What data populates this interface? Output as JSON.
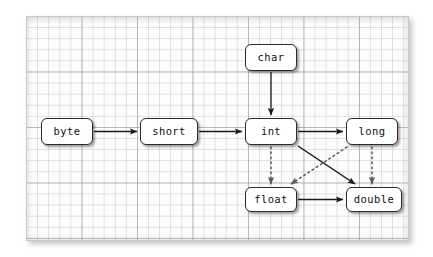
{
  "diagram": {
    "background_color": "#ffffff",
    "panel": {
      "background_color": "#fdfdfd",
      "border_color": "#c9c9c9",
      "grid_minor_color": "#c4c6cd",
      "grid_major_color": "#9699a0",
      "grid_minor_spacing_px": 11,
      "grid_major_spacing_px": 55
    },
    "node_style": {
      "fill": "#ffffff",
      "stroke": "#2b2b2b",
      "text_color": "#101010",
      "corner_radius_px": 6
    },
    "edge_style": {
      "solid_color": "#1a1a1a",
      "dotted_color": "#555555",
      "solid_label": "implicit widening (no precision loss)",
      "dotted_label": "implicit widening (possible precision loss)"
    },
    "nodes": [
      {
        "id": "byte",
        "label": "byte"
      },
      {
        "id": "short",
        "label": "short"
      },
      {
        "id": "char",
        "label": "char"
      },
      {
        "id": "int",
        "label": "int"
      },
      {
        "id": "long",
        "label": "long"
      },
      {
        "id": "float",
        "label": "float"
      },
      {
        "id": "double",
        "label": "double"
      }
    ],
    "edges": [
      {
        "from": "byte",
        "to": "short",
        "style": "solid"
      },
      {
        "from": "short",
        "to": "int",
        "style": "solid"
      },
      {
        "from": "char",
        "to": "int",
        "style": "solid"
      },
      {
        "from": "int",
        "to": "long",
        "style": "solid"
      },
      {
        "from": "int",
        "to": "double",
        "style": "solid"
      },
      {
        "from": "float",
        "to": "double",
        "style": "solid"
      },
      {
        "from": "int",
        "to": "float",
        "style": "dotted"
      },
      {
        "from": "long",
        "to": "float",
        "style": "dotted"
      },
      {
        "from": "long",
        "to": "double",
        "style": "dotted"
      }
    ]
  }
}
